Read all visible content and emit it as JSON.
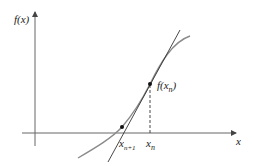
{
  "diagram": {
    "axes": {
      "y_label": "f(x)",
      "x_label": "x"
    },
    "points": {
      "fxn_label": "f(x",
      "fxn_sub": "n",
      "fxn_close": ")",
      "xn_label": "x",
      "xn_sub": "n",
      "xn1_label": "x",
      "xn1_sub": "n+1"
    },
    "colors": {
      "axis": "#555555",
      "curve": "#8a8a8a",
      "tangent": "#333333",
      "point": "#111111"
    }
  }
}
